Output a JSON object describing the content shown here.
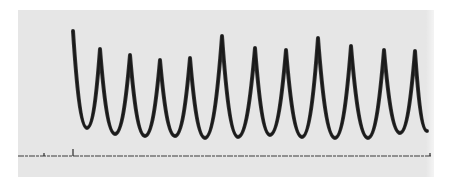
{
  "figure": {
    "type": "waveform recording",
    "colors": {
      "paper": "#e6e6e6",
      "trace": "#1a1a1a",
      "background": "#ffffff"
    },
    "trace": {
      "start": [
        73,
        31
      ],
      "extrema": [
        {
          "kind": "trough",
          "x": 87,
          "y": 128
        },
        {
          "kind": "peak",
          "x": 100,
          "y": 49
        },
        {
          "kind": "trough",
          "x": 115,
          "y": 134
        },
        {
          "kind": "peak",
          "x": 130,
          "y": 55
        },
        {
          "kind": "trough",
          "x": 145,
          "y": 136
        },
        {
          "kind": "peak",
          "x": 160,
          "y": 60
        },
        {
          "kind": "trough",
          "x": 175,
          "y": 136
        },
        {
          "kind": "peak",
          "x": 190,
          "y": 58
        },
        {
          "kind": "trough",
          "x": 205,
          "y": 138
        },
        {
          "kind": "peak",
          "x": 222,
          "y": 36
        },
        {
          "kind": "trough",
          "x": 238,
          "y": 137
        },
        {
          "kind": "peak",
          "x": 255,
          "y": 48
        },
        {
          "kind": "trough",
          "x": 270,
          "y": 135
        },
        {
          "kind": "peak",
          "x": 286,
          "y": 50
        },
        {
          "kind": "trough",
          "x": 302,
          "y": 137
        },
        {
          "kind": "peak",
          "x": 318,
          "y": 38
        },
        {
          "kind": "trough",
          "x": 335,
          "y": 138
        },
        {
          "kind": "peak",
          "x": 351,
          "y": 46
        },
        {
          "kind": "trough",
          "x": 368,
          "y": 138
        },
        {
          "kind": "peak",
          "x": 384,
          "y": 50
        },
        {
          "kind": "trough",
          "x": 400,
          "y": 133
        },
        {
          "kind": "peak",
          "x": 415,
          "y": 51
        }
      ],
      "end": [
        427,
        131
      ],
      "peak_count": 11
    },
    "baseline": {
      "y": 156,
      "x_start": 18,
      "x_end": 432,
      "marks": [
        {
          "x": 44,
          "height": 3
        },
        {
          "x": 73,
          "height": 7
        },
        {
          "x": 430,
          "height": 3
        }
      ]
    }
  }
}
